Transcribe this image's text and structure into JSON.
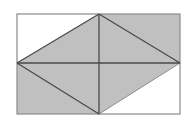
{
  "figure": {
    "colors": {
      "background": "#ffffff",
      "shade": "#c0c0c0",
      "outline": "#8a8a8a",
      "lines": "#4a4a4a",
      "light_edge": "#7a7a7a"
    },
    "rectangle": {
      "x1": 17,
      "y1": 14,
      "x2": 180,
      "y2": 114
    },
    "points": {
      "top_mid": [
        99,
        14
      ],
      "top_right": [
        180,
        14
      ],
      "right_mid": [
        180,
        63
      ],
      "bottom_mid": [
        99,
        114
      ],
      "bottom_left": [
        17,
        114
      ],
      "left_mid": [
        17,
        63
      ]
    },
    "shaded_polygon": "99,14 180,14 180,63 99,114 17,114 17,63",
    "segments": [
      {
        "name": "horizontal-midline",
        "x1": 17,
        "y1": 63,
        "x2": 180,
        "y2": 63
      },
      {
        "name": "vertical-midline",
        "x1": 99,
        "y1": 14,
        "x2": 99,
        "y2": 114
      },
      {
        "name": "diagonal-left-to-top",
        "x1": 17,
        "y1": 63,
        "x2": 99,
        "y2": 14
      },
      {
        "name": "diagonal-top-to-right",
        "x1": 99,
        "y1": 14,
        "x2": 180,
        "y2": 63
      },
      {
        "name": "diagonal-left-to-bottom",
        "x1": 17,
        "y1": 63,
        "x2": 99,
        "y2": 114
      }
    ],
    "light_segment": {
      "name": "diagonal-bottom-to-right",
      "x1": 99,
      "y1": 114,
      "x2": 180,
      "y2": 63
    }
  }
}
